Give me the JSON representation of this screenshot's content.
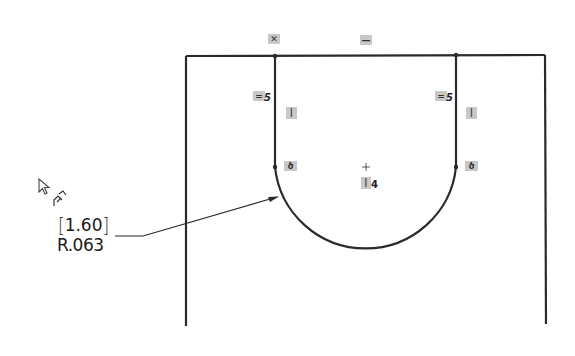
{
  "sketch": {
    "outer_frame": {
      "left_x": 186,
      "right_x": 545,
      "top_y": 55,
      "bottom_y": 325
    },
    "slot": {
      "left_x": 275,
      "right_x": 456,
      "top_y": 55,
      "tangent_y": 167,
      "center": [
        366,
        167
      ],
      "radius": 91
    },
    "stroke_color": "#2a2a2a",
    "relation_color": "#c8c8c8"
  },
  "relations": {
    "top_left": {
      "icon": "coincident-icon",
      "glyph": "✕"
    },
    "top_mid": {
      "icon": "horizontal-icon",
      "glyph": "—"
    },
    "left_equal": {
      "icon": "equal-icon",
      "glyph": "=",
      "index": "5"
    },
    "right_equal": {
      "icon": "equal-icon",
      "glyph": "=",
      "index": "5"
    },
    "left_vertical": {
      "icon": "vertical-icon",
      "glyph": "|"
    },
    "right_vertical": {
      "icon": "vertical-icon",
      "glyph": "|"
    },
    "left_tangent": {
      "icon": "tangent-icon",
      "glyph": "ծ"
    },
    "right_tangent": {
      "icon": "tangent-icon",
      "glyph": "ծ"
    },
    "center_vertical": {
      "icon": "vertical-icon",
      "glyph": "|",
      "index": "4"
    }
  },
  "dimension": {
    "value_bracket": "1.60",
    "value_radius": "R.063",
    "bracket_open": "[",
    "bracket_close": "]"
  },
  "cursor": {
    "icon": "pointer-cursor-icon",
    "badge": "smart-dimension-icon"
  }
}
